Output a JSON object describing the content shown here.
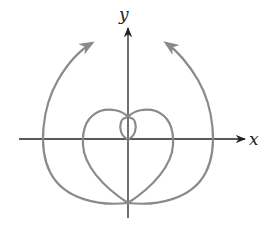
{
  "diagram": {
    "type": "polar-curve-sketch",
    "axes": {
      "x_label": "x",
      "y_label": "y",
      "axis_color": "#222222"
    },
    "curve": {
      "color": "#8a8a8a",
      "description": "Spiral-like polar curve with a small inner loop, a heart-shaped middle loop, and two outer branches ending in arrowheads pointing up and inward"
    }
  }
}
